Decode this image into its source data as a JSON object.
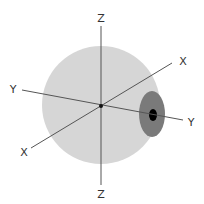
{
  "diagram": {
    "colors": {
      "sphere": "#d6d6d6",
      "iris": "#7a7a7a",
      "pupil": "#000000",
      "axis": "#555555",
      "label": "#333333",
      "background": "#ffffff"
    },
    "axes": {
      "z_top": "Z",
      "z_bottom": "Z",
      "y_left": "Y",
      "y_right": "Y",
      "x_upper_right": "X",
      "x_lower_left": "X"
    }
  }
}
